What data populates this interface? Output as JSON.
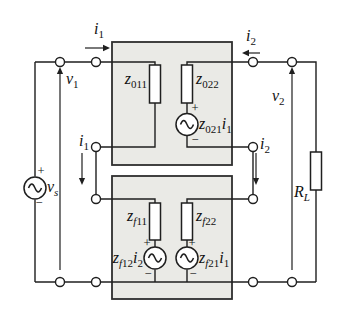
{
  "figure": {
    "background": "#ffffff",
    "wire_color": "#1f1f1f",
    "box_fill": "#eaeae6",
    "box_border": "#2e2e2e",
    "component_fill": "#ffffff"
  },
  "labels": {
    "i1_top": {
      "base": "i",
      "sub": "1"
    },
    "i2_top": {
      "base": "i",
      "sub": "2"
    },
    "v1": {
      "base": "v",
      "sub": "1"
    },
    "v2": {
      "base": "v",
      "sub": "2"
    },
    "vs": {
      "base": "v",
      "sub": "s"
    },
    "rl": {
      "base": "R",
      "sub": "L"
    },
    "z011": {
      "base": "z",
      "sub": "011"
    },
    "z022": {
      "base": "z",
      "sub": "022"
    },
    "z021i1": {
      "base": "z",
      "sub": "021",
      "base2": "i",
      "sub2": "1"
    },
    "zf11": {
      "base": "z",
      "subf": "f",
      "subn": "11"
    },
    "zf22": {
      "base": "z",
      "subf": "f",
      "subn": "22"
    },
    "zf12i2": {
      "base": "z",
      "subf": "f",
      "subn": "12",
      "base2": "i",
      "sub2": "2"
    },
    "zf21i1": {
      "base": "z",
      "subf": "f",
      "subn": "21",
      "base2": "i",
      "sub2": "1"
    },
    "i1_inner": {
      "base": "i",
      "sub": "1"
    },
    "i2_inner": {
      "base": "i",
      "sub": "2"
    }
  },
  "polarity": {
    "plus": "+",
    "minus": "−"
  }
}
